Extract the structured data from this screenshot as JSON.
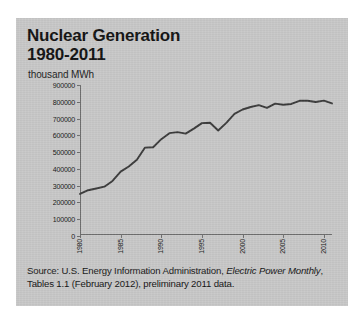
{
  "figure": {
    "title_line1": "Nuclear Generation",
    "title_line2": "1980-2011",
    "units_label": "thousand MWh",
    "source_prefix": "Source: U.S. Energy Information Administration, ",
    "source_italic": "Electric Power Monthly",
    "source_suffix": ", Tables 1.1 (February 2012), preliminary  2011 data.",
    "background_color": "#c8c8c8",
    "line_color": "#3a3a3a",
    "axis_color": "#6e6e6e"
  },
  "chart_data": {
    "type": "line",
    "title": "Nuclear Generation 1980-2011",
    "xlabel": "",
    "ylabel": "thousand MWh",
    "ylim": [
      0,
      900000
    ],
    "xlim": [
      1980,
      2011
    ],
    "grid": false,
    "legend": "none",
    "ytick_labels": [
      "900000",
      "800000",
      "700000",
      "600000",
      "500000",
      "400000",
      "300000",
      "200000",
      "100000",
      "0"
    ],
    "ytick_values": [
      900000,
      800000,
      700000,
      600000,
      500000,
      400000,
      300000,
      200000,
      100000,
      0
    ],
    "xtick_labels": [
      "1980",
      "1985",
      "1990",
      "1995",
      "2000",
      "2005",
      "2010"
    ],
    "xtick_values": [
      1980,
      1985,
      1990,
      1995,
      2000,
      2005,
      2010
    ],
    "x": [
      1980,
      1981,
      1982,
      1983,
      1984,
      1985,
      1986,
      1987,
      1988,
      1989,
      1990,
      1991,
      1992,
      1993,
      1994,
      1995,
      1996,
      1997,
      1998,
      1999,
      2000,
      2001,
      2002,
      2003,
      2004,
      2005,
      2006,
      2007,
      2008,
      2009,
      2010,
      2011
    ],
    "series": [
      {
        "name": "Nuclear Generation",
        "values": [
          251000,
          273000,
          283000,
          294000,
          328000,
          384000,
          414000,
          455000,
          527000,
          529000,
          577000,
          613000,
          619000,
          610000,
          640000,
          673000,
          675000,
          629000,
          674000,
          728000,
          754000,
          769000,
          780000,
          764000,
          789000,
          782000,
          787000,
          806000,
          806000,
          799000,
          807000,
          790000
        ]
      }
    ]
  }
}
